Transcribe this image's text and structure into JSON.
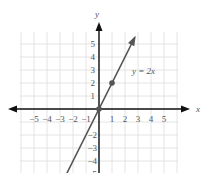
{
  "chart_data": {
    "type": "line",
    "title": "",
    "xlabel": "x",
    "ylabel": "y",
    "xlim": [
      -5,
      5
    ],
    "ylim": [
      -5,
      5
    ],
    "grid": true,
    "x_ticks": [
      "−5",
      "−4",
      "−3",
      "−2",
      "−1",
      "1",
      "2",
      "3",
      "4",
      "5"
    ],
    "y_ticks_positive": [
      "1",
      "2",
      "3",
      "4",
      "5"
    ],
    "y_ticks_negative": [
      "−2",
      "−3",
      "−4",
      "−5"
    ],
    "series": [
      {
        "name": "y = 2x",
        "equation": "y = 2x",
        "x": [
          -2.5,
          0,
          1,
          2.8
        ],
        "y": [
          -5,
          0,
          2,
          5.6
        ],
        "points_marked": [
          [
            0,
            0
          ],
          [
            1,
            2
          ]
        ]
      }
    ],
    "annotations": [
      {
        "text": "y = 2x",
        "x": 2.5,
        "y": 2.8
      }
    ],
    "colors": {
      "line": "#555555",
      "axis": "#111111",
      "grid": "#dddddd",
      "point": "#555555"
    }
  }
}
